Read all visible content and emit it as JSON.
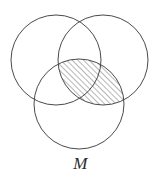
{
  "figure": {
    "label": "M",
    "background_color": "#ffffff",
    "stroke_color": "#4a4a4a",
    "hatch_color": "#4a4a4a",
    "hatch_angle_degrees": 45,
    "hatch_spacing_px": 4,
    "stroke_width_px": 1
  },
  "chart_data": {
    "type": "diagram",
    "subtype": "venn-3-circle",
    "title": "",
    "circles": [
      {
        "name": "top-left-circle",
        "cx": 56,
        "cy": 60,
        "r": 45,
        "shaded": false
      },
      {
        "name": "top-right-circle",
        "cx": 103,
        "cy": 60,
        "r": 45,
        "shaded": false
      },
      {
        "name": "bottom-circle",
        "cx": 79,
        "cy": 104,
        "r": 45,
        "shaded": false
      }
    ],
    "shaded_regions": [
      {
        "name": "right-bottom-intersection",
        "members": [
          "top-right-circle",
          "bottom-circle"
        ],
        "fill": "diagonal-hatch",
        "angle_degrees": 45
      }
    ],
    "annotations": [
      {
        "text": "M",
        "x": 79,
        "y": 168,
        "style": "italic-serif"
      }
    ]
  }
}
